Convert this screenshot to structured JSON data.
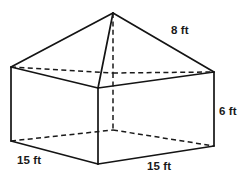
{
  "figure": {
    "name": "composite-solid-pyramid-on-rectangular-prism",
    "stroke_color": "#141414",
    "background_color": "#ffffff"
  },
  "labels": {
    "slant_edge": "8 ft",
    "prism_height": "6 ft",
    "base_left": "15 ft",
    "base_right": "15 ft"
  },
  "measurements": [
    {
      "id": "slant-edge",
      "value": 8,
      "unit": "ft",
      "text": "8 ft",
      "applies_to": "pyramid-lateral-edge-right"
    },
    {
      "id": "prism-height",
      "value": 6,
      "unit": "ft",
      "text": "6 ft",
      "applies_to": "prism-vertical-edge-right"
    },
    {
      "id": "base-depth",
      "value": 15,
      "unit": "ft",
      "text": "15 ft",
      "applies_to": "prism-base-edge-front-left"
    },
    {
      "id": "base-width",
      "value": 15,
      "unit": "ft",
      "text": "15 ft",
      "applies_to": "prism-base-edge-front-right"
    }
  ],
  "geometry": {
    "apex": {
      "x": 113,
      "y": 13
    },
    "top_face": {
      "left": {
        "x": 11,
        "y": 67,
        "hidden": false
      },
      "back": {
        "x": 113,
        "y": 73,
        "hidden": true
      },
      "right": {
        "x": 214,
        "y": 72,
        "hidden": false
      },
      "front": {
        "x": 98,
        "y": 88,
        "hidden": false
      }
    },
    "bottom_face": {
      "left": {
        "x": 11,
        "y": 141,
        "hidden": false
      },
      "back": {
        "x": 113,
        "y": 130,
        "hidden": true
      },
      "right": {
        "x": 214,
        "y": 146,
        "hidden": false
      },
      "front": {
        "x": 98,
        "y": 164,
        "hidden": false
      }
    }
  }
}
